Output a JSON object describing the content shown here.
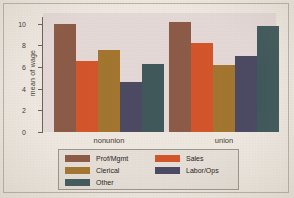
{
  "chart_data": {
    "type": "bar",
    "title": "",
    "xlabel": "",
    "ylabel": "mean of wage",
    "categories": [
      "nonunion",
      "union"
    ],
    "ylim": [
      0,
      10.6
    ],
    "yticks": [
      0,
      2,
      4,
      6,
      8,
      10
    ],
    "ytick_labels": [
      "0",
      "2",
      "4",
      "6",
      "8",
      "10"
    ],
    "grid": false,
    "legend_position": "bottom",
    "series": [
      {
        "name": "Prof/Mgmt",
        "color": "#8c5b47",
        "values": [
          9.95,
          10.1
        ]
      },
      {
        "name": "Sales",
        "color": "#d4552a",
        "values": [
          6.5,
          8.2
        ]
      },
      {
        "name": "Clerical",
        "color": "#a3762f",
        "values": [
          7.6,
          6.2
        ]
      },
      {
        "name": "Labor/Ops",
        "color": "#4c4a63",
        "values": [
          4.6,
          7.0
        ]
      },
      {
        "name": "Other",
        "color": "#3f585a",
        "values": [
          6.3,
          9.8
        ]
      }
    ]
  },
  "axis": {
    "y_title": "mean of wage"
  },
  "legend": {
    "left_column": [
      "Prof/Mgmt",
      "Clerical",
      "Other"
    ],
    "right_column": [
      "Sales",
      "Labor/Ops"
    ]
  },
  "colors": {
    "plot_background": "#e4d9d6",
    "page_background": "#eee8e0",
    "legend_background": "#e6dfd7",
    "axis": "#6b6258",
    "text": "#3f3a34"
  }
}
